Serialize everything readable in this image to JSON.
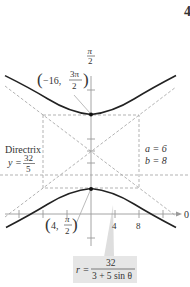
{
  "figure": {
    "corner_mark": "4",
    "axes": {
      "polar_axis_label": "0",
      "vertical_axis_label_num": "π",
      "vertical_axis_label_den": "2",
      "x_tick_labels": [
        "4",
        "8"
      ]
    },
    "points": [
      {
        "name": "upper-vertex",
        "r": "−16,",
        "theta_num": "3π",
        "theta_den": "2"
      },
      {
        "name": "lower-vertex",
        "r": "4,",
        "theta_num": "π",
        "theta_den": "2"
      }
    ],
    "directrix": {
      "label": "Directrix",
      "lhs": "y =",
      "num": "32",
      "den": "5"
    },
    "params": {
      "a_label": "a = 6",
      "b_label": "b = 8"
    },
    "equation": {
      "lhs": "r =",
      "num": "32",
      "den": "3 + 5 sin θ"
    },
    "colors": {
      "curve": "#222222",
      "dashed": "#aaaaaa",
      "axis": "#999999",
      "callout": "#d9d9d9",
      "equation_box": "#e6e6e6"
    }
  }
}
